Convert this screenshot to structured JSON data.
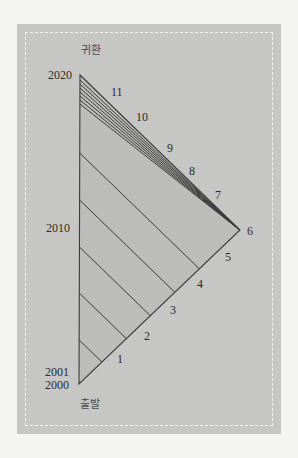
{
  "diagram": {
    "top_label": "귀환",
    "bottom_label": "출발",
    "year_labels": {
      "y2020": "2020",
      "y2010": "2010",
      "y2001": "2001",
      "y2000": "2000"
    },
    "hypotenuse_labels": {
      "n1": "1",
      "n2": "2",
      "n3": "3",
      "n4": "4",
      "n5": "5",
      "n6": "6",
      "n7": "7",
      "n8": "8",
      "n9": "9",
      "n10": "10",
      "n11": "11"
    },
    "colors": {
      "panel": "#c6c6c5",
      "triangle_fill": "#bcbcbb",
      "line": "#3a3a3a",
      "dashed_border": "#f2f2f2"
    },
    "geometry": {
      "apex_top": [
        80,
        75
      ],
      "apex_bottom": [
        79,
        384
      ],
      "apex_right": [
        240,
        230
      ],
      "lower_fan_left_y": [
        340,
        293,
        247,
        200,
        153
      ],
      "upper_fan_left_y": [
        80,
        84,
        88,
        92,
        96,
        100,
        104
      ]
    }
  }
}
